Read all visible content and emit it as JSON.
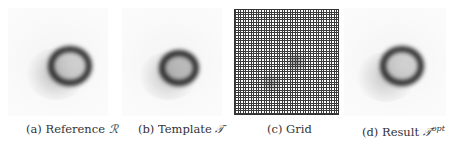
{
  "figure": {
    "panels": [
      {
        "id": "a",
        "caption_prefix": "(a) Reference",
        "symbol": "ℛ",
        "superscript": "",
        "content": "blurred ring image"
      },
      {
        "id": "b",
        "caption_prefix": "(b) Template",
        "symbol": "𝒯",
        "superscript": "",
        "content": "blurred ring image"
      },
      {
        "id": "c",
        "caption_prefix": "(c) Grid",
        "symbol": "",
        "superscript": "",
        "content": "deformation grid"
      },
      {
        "id": "d",
        "caption_prefix": "(d) Result",
        "symbol": "𝒯",
        "superscript": "opt",
        "content": "blurred ring image"
      }
    ]
  },
  "colors": {
    "background": "#ffffff",
    "ring": "#1a1a1a",
    "grid_lines": "#3a3a3a",
    "caption_text": "#333333"
  }
}
